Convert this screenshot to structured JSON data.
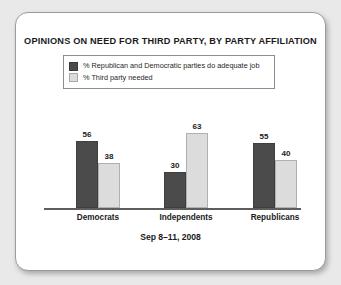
{
  "chart_data": {
    "type": "bar",
    "title": "OPINIONS ON NEED FOR THIRD PARTY, BY PARTY AFFILIATION",
    "subtitle": "Sep 8–11, 2008",
    "categories": [
      "Democrats",
      "Independents",
      "Republicans"
    ],
    "series": [
      {
        "name": "% Republican and Democratic parties do adequate job",
        "values": [
          56,
          30,
          55
        ],
        "color": "#4b4b4b"
      },
      {
        "name": "% Third party needed",
        "values": [
          38,
          63,
          40
        ],
        "color": "#dcdcdc"
      }
    ],
    "xlabel": "",
    "ylabel": "",
    "ylim": [
      0,
      63
    ],
    "grid": false,
    "legend_position": "top",
    "data_labels": true
  },
  "card": {
    "background": "#ffffff",
    "border_color": "#9b9b9b"
  },
  "page": {
    "background": "#e9e9e9"
  }
}
